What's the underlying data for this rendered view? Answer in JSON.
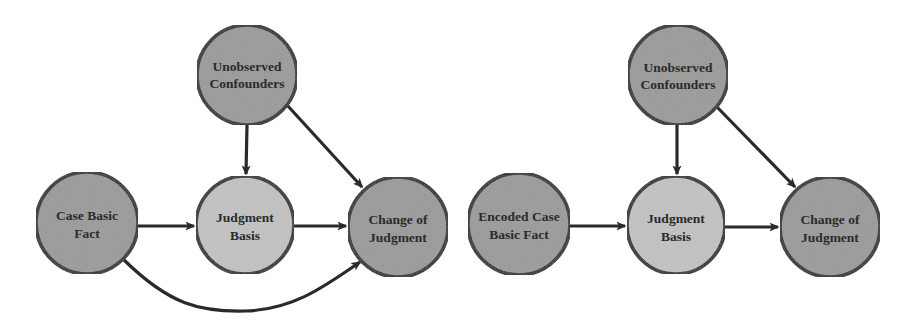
{
  "colors": {
    "background": "#ffffff",
    "node_fill_dark": "#9a9a9a",
    "node_fill_light": "#c2c2c2",
    "node_stroke": "#2a2a2a",
    "edge": "#2a2a2a",
    "label": "#2b2b2b"
  },
  "diagrams": [
    {
      "name": "left-causal-graph",
      "nodes": [
        {
          "id": "confounders",
          "line1": "Unobserved",
          "line2": "Confounders",
          "cx": 247,
          "cy": 75,
          "r": 50,
          "shade": "dark"
        },
        {
          "id": "case_fact",
          "line1": "Case Basic",
          "line2": "Fact",
          "cx": 87,
          "cy": 223,
          "r": 51,
          "shade": "dark"
        },
        {
          "id": "basis",
          "line1": "Judgment",
          "line2": "Basis",
          "cx": 245,
          "cy": 225,
          "r": 49,
          "shade": "light"
        },
        {
          "id": "change",
          "line1": "Change of",
          "line2": "Judgment",
          "cx": 398,
          "cy": 227,
          "r": 50,
          "shade": "dark"
        }
      ],
      "edges": [
        {
          "from": "confounders",
          "to": "basis",
          "type": "straight"
        },
        {
          "from": "confounders",
          "to": "change",
          "type": "straight"
        },
        {
          "from": "case_fact",
          "to": "basis",
          "type": "straight"
        },
        {
          "from": "basis",
          "to": "change",
          "type": "straight"
        },
        {
          "from": "case_fact",
          "to": "change",
          "type": "curved"
        }
      ]
    },
    {
      "name": "right-causal-graph",
      "nodes": [
        {
          "id": "confounders",
          "line1": "Unobserved",
          "line2": "Confounders",
          "cx": 678,
          "cy": 75,
          "r": 50,
          "shade": "dark"
        },
        {
          "id": "encoded_fact",
          "line1": "Encoded Case",
          "line2": "Basic Fact",
          "cx": 519,
          "cy": 224,
          "r": 51,
          "shade": "dark"
        },
        {
          "id": "basis",
          "line1": "Judgment",
          "line2": "Basis",
          "cx": 676,
          "cy": 225,
          "r": 49,
          "shade": "light"
        },
        {
          "id": "change",
          "line1": "Change of",
          "line2": "Judgment",
          "cx": 830,
          "cy": 227,
          "r": 50,
          "shade": "dark"
        }
      ],
      "edges": [
        {
          "from": "confounders",
          "to": "basis",
          "type": "straight"
        },
        {
          "from": "confounders",
          "to": "change",
          "type": "straight"
        },
        {
          "from": "encoded_fact",
          "to": "basis",
          "type": "straight"
        },
        {
          "from": "basis",
          "to": "change",
          "type": "straight"
        }
      ]
    }
  ],
  "labels": {
    "left": {
      "confounders_1": "Unobserved",
      "confounders_2": "Confounders",
      "fact_1": "Case Basic",
      "fact_2": "Fact",
      "basis_1": "Judgment",
      "basis_2": "Basis",
      "change_1": "Change of",
      "change_2": "Judgment"
    },
    "right": {
      "confounders_1": "Unobserved",
      "confounders_2": "Confounders",
      "fact_1": "Encoded Case",
      "fact_2": "Basic Fact",
      "basis_1": "Judgment",
      "basis_2": "Basis",
      "change_1": "Change of",
      "change_2": "Judgment"
    }
  }
}
